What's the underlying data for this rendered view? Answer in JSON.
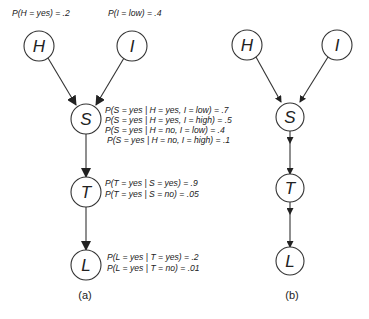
{
  "diagram_a": {
    "caption": "(a)",
    "nodes": {
      "H": {
        "label": "H"
      },
      "I": {
        "label": "I"
      },
      "S": {
        "label": "S"
      },
      "T": {
        "label": "T"
      },
      "L": {
        "label": "L"
      }
    },
    "priors": {
      "H": "P(H = yes) = .2",
      "I": "P(I = low) = .4"
    },
    "cpt_S": [
      "P(S = yes | H = yes, I = low) = .7",
      "P(S = yes | H = yes, I = high) = .5",
      "P(S = yes | H = no, I = low) = .4",
      "P(S = yes | H = no, I = high) = .1"
    ],
    "cpt_T": [
      "P(T = yes | S = yes) = .9",
      "P(T = yes | S = no) = .05"
    ],
    "cpt_L": [
      "P(L = yes | T = yes) = .2",
      "P(L = yes | T = no) = .01"
    ],
    "edges": [
      [
        "H",
        "S"
      ],
      [
        "I",
        "S"
      ],
      [
        "S",
        "T"
      ],
      [
        "T",
        "L"
      ]
    ]
  },
  "diagram_b": {
    "caption": "(b)",
    "nodes": {
      "H": {
        "label": "H"
      },
      "I": {
        "label": "I"
      },
      "S": {
        "label": "S"
      },
      "T": {
        "label": "T"
      },
      "L": {
        "label": "L"
      }
    },
    "edges": [
      [
        "H",
        "S"
      ],
      [
        "I",
        "S"
      ],
      [
        "S",
        "T"
      ],
      [
        "T",
        "L"
      ]
    ]
  },
  "colors": {
    "stroke": "#333333",
    "text": "#222222",
    "background": "#ffffff"
  }
}
